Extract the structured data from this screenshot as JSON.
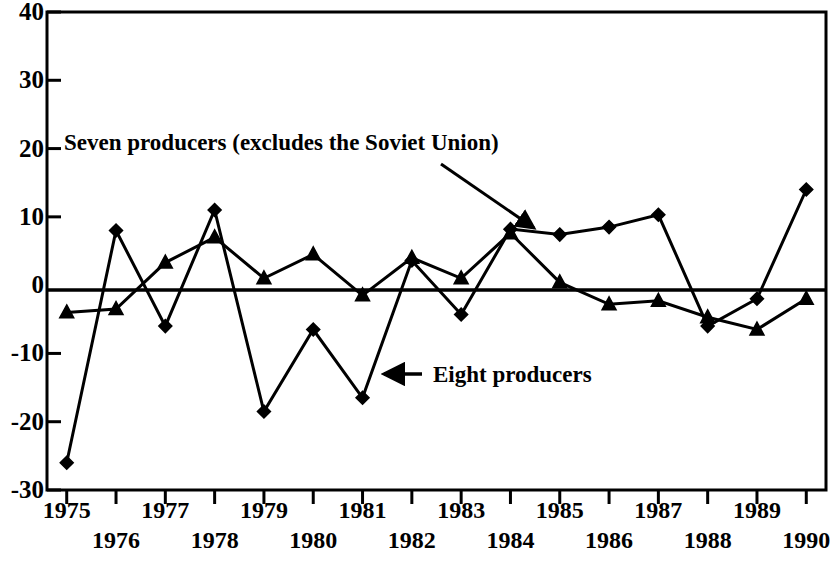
{
  "chart_data": {
    "type": "line",
    "title": "",
    "xlabel": "",
    "ylabel": "",
    "x": [
      1975,
      1976,
      1977,
      1978,
      1979,
      1980,
      1981,
      1982,
      1983,
      1984,
      1985,
      1986,
      1987,
      1988,
      1989,
      1990
    ],
    "xlim": [
      1974.6,
      1990.4
    ],
    "ylim": [
      -30,
      40
    ],
    "yticks": [
      -30,
      -20,
      -10,
      0,
      10,
      20,
      30,
      40
    ],
    "ytick_labels": [
      "-30",
      "-20",
      "-10",
      "0",
      "10",
      "20",
      "30",
      "40"
    ],
    "xtick_labels": [
      "1975",
      "1976",
      "1977",
      "1978",
      "1979",
      "1980",
      "1981",
      "1982",
      "1983",
      "1984",
      "1985",
      "1986",
      "1987",
      "1988",
      "1989",
      "1990"
    ],
    "grid": false,
    "legend_position": "inline-annotations",
    "zero_line": true,
    "series": [
      {
        "name": "Seven producers (excludes the Soviet Union)",
        "marker": "diamond",
        "values": [
          -26.0,
          8.0,
          -6.0,
          11.0,
          -18.5,
          -6.5,
          -16.5,
          3.6,
          -4.3,
          8.2,
          7.4,
          8.5,
          10.3,
          -6.0,
          -2.0,
          14.0
        ]
      },
      {
        "name": "Eight producers",
        "marker": "triangle",
        "values": [
          -4.0,
          -3.5,
          3.3,
          7.0,
          1.0,
          4.5,
          -1.5,
          4.0,
          1.0,
          7.6,
          0.4,
          -2.8,
          -2.3,
          -4.7,
          -6.5,
          -2.0
        ]
      }
    ],
    "annotations": [
      {
        "text": "Seven producers (excludes the Soviet Union)",
        "points_to_series": "Seven producers (excludes the Soviet Union)",
        "points_to_x": 1985
      },
      {
        "text": "Eight producers",
        "points_to_series": "Eight producers",
        "points_to_x": 1981
      }
    ]
  },
  "axis": {
    "y_labels": [
      "40",
      "30",
      "20",
      "10",
      "0",
      "-10",
      "-20",
      "-30"
    ],
    "x_labels_top_row": [
      "1975",
      "1977",
      "1979",
      "1981",
      "1983",
      "1985",
      "1987",
      "1989"
    ],
    "x_labels_bottom_row": [
      "1976",
      "1978",
      "1980",
      "1982",
      "1984",
      "1986",
      "1988",
      "1990"
    ]
  },
  "colors": {
    "ink": "#000000",
    "background": "#ffffff"
  }
}
